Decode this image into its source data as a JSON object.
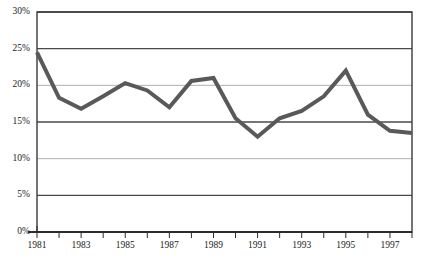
{
  "chart_data": {
    "type": "line",
    "title": "",
    "subtitle": "",
    "xlabel": "",
    "ylabel": "",
    "x": [
      1981,
      1982,
      1983,
      1984,
      1985,
      1986,
      1987,
      1988,
      1989,
      1990,
      1991,
      1992,
      1993,
      1994,
      1995,
      1996,
      1997,
      1998
    ],
    "values": [
      24.5,
      18.3,
      16.8,
      18.5,
      20.3,
      19.3,
      17.0,
      20.6,
      21.0,
      15.5,
      13.0,
      15.5,
      16.5,
      18.5,
      22.0,
      16.0,
      13.8,
      13.5
    ],
    "series": [
      {
        "name": "",
        "values": [
          24.5,
          18.3,
          16.8,
          18.5,
          20.3,
          19.3,
          17.0,
          20.6,
          21.0,
          15.5,
          13.0,
          15.5,
          16.5,
          18.5,
          22.0,
          16.0,
          13.8,
          13.5
        ]
      }
    ],
    "ylim": [
      0,
      30
    ],
    "xlim": [
      1981,
      1998
    ],
    "y_ticks": [
      0,
      5,
      10,
      15,
      20,
      25,
      30
    ],
    "y_tick_labels": [
      "0%",
      "5%",
      "10%",
      "15%",
      "20%",
      "25%",
      "30%"
    ],
    "x_ticks": [
      1981,
      1982,
      1983,
      1984,
      1985,
      1986,
      1987,
      1988,
      1989,
      1990,
      1991,
      1992,
      1993,
      1994,
      1995,
      1996,
      1997,
      1998
    ],
    "x_tick_labels": [
      "1981",
      "",
      "1983",
      "",
      "1985",
      "",
      "1987",
      "",
      "1989",
      "",
      "1991",
      "",
      "1993",
      "",
      "1995",
      "",
      "1997",
      ""
    ],
    "grid": true,
    "legend": false,
    "legend_position": "none",
    "line_color": "#595959",
    "grid_color_major": "#4a4a4a",
    "grid_color_minor": "#a8a8a8",
    "border_color": "#3a3a3a",
    "background_color": "#ffffff",
    "line_width": 4
  }
}
